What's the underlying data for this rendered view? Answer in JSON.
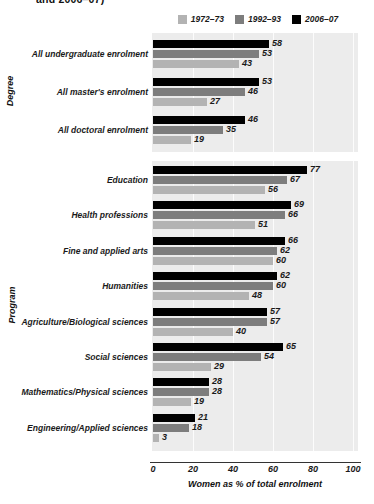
{
  "title_fragment": "and 2006–07)",
  "legend": {
    "position": "top",
    "items": [
      {
        "label": "1972–73",
        "color": "#b3b3b3"
      },
      {
        "label": "1992–93",
        "color": "#7d7d7d"
      },
      {
        "label": "2006–07",
        "color": "#000000"
      }
    ]
  },
  "axis": {
    "x_title": "Women as % of total enrolment",
    "ticks": [
      "0",
      "20",
      "40",
      "60",
      "80",
      "100"
    ],
    "xlim": [
      0,
      100
    ]
  },
  "panels": [
    {
      "axis_title": "Degree"
    },
    {
      "axis_title": "Program"
    }
  ],
  "chart_data": {
    "type": "bar",
    "orientation": "horizontal",
    "title": "and 2006–07)",
    "xlabel": "Women as % of total enrolment",
    "ylabel": "",
    "xlim": [
      0,
      100
    ],
    "xticks": [
      0,
      20,
      40,
      60,
      80,
      100
    ],
    "grid": true,
    "legend_position": "top",
    "series": [
      {
        "name": "1972–73",
        "color": "#b3b3b3"
      },
      {
        "name": "1992–93",
        "color": "#7d7d7d"
      },
      {
        "name": "2006–07",
        "color": "#000000"
      }
    ],
    "panels": [
      {
        "name": "Degree",
        "categories": [
          "All undergraduate enrolment",
          "All master's enrolment",
          "All doctoral enrolment"
        ],
        "values": {
          "1972–73": [
            43,
            27,
            19
          ],
          "1992–93": [
            53,
            46,
            35
          ],
          "2006–07": [
            58,
            53,
            46
          ]
        }
      },
      {
        "name": "Program",
        "categories": [
          "Education",
          "Health professions",
          "Fine and applied arts",
          "Humanities",
          "Agriculture/Biological sciences",
          "Social sciences",
          "Mathematics/Physical sciences",
          "Engineering/Applied sciences"
        ],
        "values": {
          "1972–73": [
            56,
            51,
            60,
            48,
            40,
            29,
            19,
            3
          ],
          "1992–93": [
            67,
            66,
            62,
            60,
            57,
            54,
            28,
            18
          ],
          "2006–07": [
            77,
            69,
            66,
            62,
            57,
            65,
            28,
            21
          ]
        }
      }
    ]
  }
}
